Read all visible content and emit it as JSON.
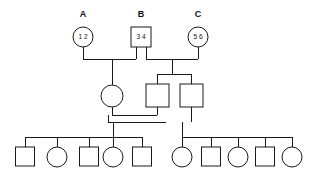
{
  "diagram": {
    "type": "pedigree-chart",
    "title": "",
    "background_color": "#ffffff",
    "stroke_color": "#1a1a1a"
  },
  "generation_labels": [
    {
      "id": "label-a",
      "text": "A",
      "x": 83,
      "y": 15
    },
    {
      "id": "label-b",
      "text": "B",
      "x": 141,
      "y": 15
    },
    {
      "id": "label-c",
      "text": "C",
      "x": 198,
      "y": 15
    }
  ],
  "generation_1": {
    "individuals": [
      {
        "id": "A",
        "shape": "circle",
        "sex": "female",
        "label": "A",
        "alleles": "1 2",
        "cx": 83,
        "cy": 37,
        "r": 10
      },
      {
        "id": "B",
        "shape": "square",
        "sex": "male",
        "label": "B",
        "alleles": "3 4",
        "x": 131,
        "y": 27,
        "size": 20
      },
      {
        "id": "C",
        "shape": "circle",
        "sex": "female",
        "label": "C",
        "alleles": "5 6",
        "cx": 198,
        "cy": 37,
        "r": 10
      }
    ]
  },
  "generation_2": {
    "individuals": [
      {
        "id": "II-1",
        "shape": "circle",
        "sex": "female",
        "alleles": "",
        "cx": 112,
        "cy": 96,
        "r": 11
      },
      {
        "id": "II-2",
        "shape": "square",
        "sex": "male",
        "alleles": "",
        "x": 146,
        "y": 84,
        "size": 23
      },
      {
        "id": "II-3",
        "shape": "square",
        "sex": "male",
        "alleles": "",
        "x": 180,
        "y": 84,
        "size": 23
      }
    ]
  },
  "generation_3": {
    "left_sibship": [
      {
        "id": "III-1",
        "shape": "square",
        "sex": "male",
        "cx": 25,
        "cy": 157,
        "size": 19
      },
      {
        "id": "III-2",
        "shape": "circle",
        "sex": "female",
        "cx": 57,
        "cy": 157,
        "r": 10
      },
      {
        "id": "III-3",
        "shape": "square",
        "sex": "male",
        "cx": 89,
        "cy": 157,
        "size": 19
      },
      {
        "id": "III-4",
        "shape": "circle",
        "sex": "female",
        "cx": 113,
        "cy": 157,
        "r": 10
      },
      {
        "id": "III-5",
        "shape": "square",
        "sex": "male",
        "cx": 142,
        "cy": 157,
        "size": 19
      }
    ],
    "right_sibship": [
      {
        "id": "III-6",
        "shape": "circle",
        "sex": "female",
        "cx": 182,
        "cy": 157,
        "r": 10
      },
      {
        "id": "III-7",
        "shape": "square",
        "sex": "male",
        "cx": 211,
        "cy": 157,
        "size": 19
      },
      {
        "id": "III-8",
        "shape": "circle",
        "sex": "female",
        "cx": 238,
        "cy": 157,
        "r": 10
      },
      {
        "id": "III-9",
        "shape": "square",
        "sex": "male",
        "cx": 265,
        "cy": 157,
        "size": 19
      },
      {
        "id": "III-10",
        "shape": "circle",
        "sex": "female",
        "cx": 292,
        "cy": 157,
        "r": 10
      }
    ]
  },
  "connections": {
    "mating_line_1_label": "A x B",
    "mating_line_2_label": "B x C",
    "mating_line_3_label": "II-1 x II-2",
    "sibship_line_1_label": "children of A and B",
    "sibship_line_2_label": "children of B and C",
    "sibship_line_3_label": "children of II-1 and II-2",
    "sibship_line_4_label": "children of II-3"
  }
}
